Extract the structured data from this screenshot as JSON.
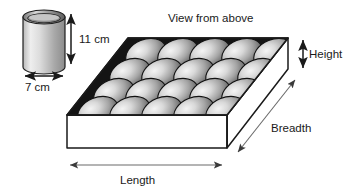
{
  "diagram": {
    "title_note": "View from above",
    "cylinder": {
      "name": "cylinder",
      "height_label": "11 cm",
      "diameter_label": "7 cm"
    },
    "tray": {
      "name": "egg-tray-box",
      "length_label": "Length",
      "breadth_label": "Breadth",
      "height_label": "Height",
      "egg_rows": 4,
      "egg_cols": 5,
      "egg_total": 20
    },
    "colors": {
      "outline": "#1a1a1a",
      "text": "#1a1a1a",
      "arrow": "#555555",
      "tray_top_base": "#111111",
      "box_face": "#ffffff",
      "cylinder_light": "#f2f2f2",
      "cylinder_dark": "#8d8d8d",
      "egg_light": "#f0f0f0",
      "egg_dark": "#4a4a4a"
    }
  }
}
